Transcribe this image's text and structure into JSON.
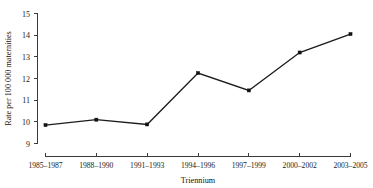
{
  "chart_data": {
    "type": "line",
    "title": "",
    "subtitle": "",
    "xlabel": "Triennium",
    "ylabel": "Rate per 100 000 maternities",
    "categories": [
      "1985–1987",
      "1988–1990",
      "1991–1993",
      "1994–1996",
      "1997–1999",
      "2000–2002",
      "2003–2005"
    ],
    "values": [
      9.85,
      10.1,
      9.88,
      12.25,
      11.45,
      13.2,
      14.05
    ],
    "series": [
      {
        "name": "Rate per 100 000 maternities",
        "values": [
          9.85,
          10.1,
          9.88,
          12.25,
          11.45,
          13.2,
          14.05
        ]
      }
    ],
    "ylim": [
      9,
      15
    ],
    "yticks": [
      9,
      10,
      11,
      12,
      13,
      14,
      15
    ],
    "ytick_labels": [
      "9",
      "10",
      "11",
      "12",
      "13",
      "14",
      "15"
    ],
    "xtick_labels": [
      "1985–1987",
      "1988–1990",
      "1991–1993",
      "1994–1996",
      "1997–1999",
      "2000–2002",
      "2003–2005"
    ],
    "grid": false,
    "legend": false,
    "legend_position": "none",
    "marker": "square",
    "line_color": "#1c1c1c",
    "marker_color": "#111111",
    "background_color": "#ffffff",
    "axis_color": "#3b3b3b"
  }
}
